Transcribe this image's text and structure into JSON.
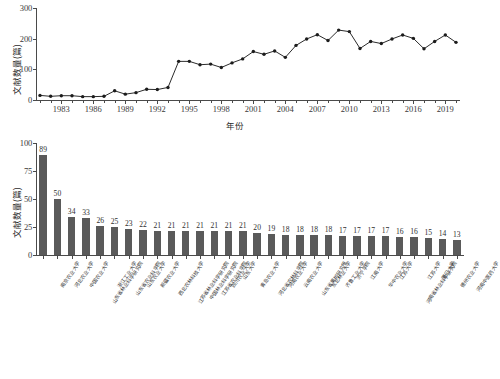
{
  "chart_data": [
    {
      "type": "line",
      "title": "",
      "xlabel": "年份",
      "ylabel": "文献数量(篇)",
      "ylim": [
        0,
        300
      ],
      "yticks": [
        0,
        100,
        200,
        300
      ],
      "xticks": [
        1983,
        1986,
        1989,
        1992,
        1995,
        1998,
        2001,
        2004,
        2007,
        2010,
        2013,
        2016,
        2019
      ],
      "xlim": [
        1981,
        2020
      ],
      "grid": false,
      "marker": "filled-circle",
      "x": [
        1981,
        1982,
        1983,
        1984,
        1985,
        1986,
        1987,
        1988,
        1989,
        1990,
        1991,
        1992,
        1993,
        1994,
        1995,
        1996,
        1997,
        1998,
        1999,
        2000,
        2001,
        2002,
        2003,
        2004,
        2005,
        2006,
        2007,
        2008,
        2009,
        2010,
        2011,
        2012,
        2013,
        2014,
        2015,
        2016,
        2017,
        2018,
        2019,
        2020
      ],
      "values": [
        15,
        12,
        14,
        14,
        11,
        11,
        12,
        30,
        19,
        24,
        35,
        34,
        41,
        126,
        126,
        115,
        117,
        106,
        121,
        134,
        158,
        149,
        160,
        139,
        178,
        199,
        213,
        194,
        228,
        223,
        168,
        191,
        184,
        199,
        212,
        201,
        167,
        191,
        212,
        188
      ]
    },
    {
      "type": "bar",
      "title": "",
      "xlabel": "",
      "ylabel": "文献数量(篇)",
      "ylim": [
        0,
        100
      ],
      "yticks": [
        0,
        25,
        50,
        75,
        100
      ],
      "grid": false,
      "bar_color": "#5a5a5a",
      "categories": [
        "南京农业大学",
        "河北农业大学",
        "中国农业大学",
        "山东省林业科学研究院",
        "浙江工业大学",
        "山东省农业科学院",
        "山东农业大学",
        "新疆农业大学",
        "西北农林科技大学",
        "江苏省林业科学研究院",
        "中国林业科学研究院",
        "江苏省农业科学院",
        "四川农业大学",
        "山东大学",
        "青岛农业大学",
        "河北省农林科学院",
        "河南农业大学",
        "云南农业大学",
        "山东省果树研究所",
        "东北林业大学",
        "齐鲁工业大学",
        "济宁学院",
        "江南大学",
        "华中农业大学",
        "江苏大学",
        "河南省林业科学研究院",
        "江苏大学",
        "厦门大学",
        "德州农业大学",
        "河南中医药大学"
      ],
      "values": [
        89,
        50,
        34,
        33,
        26,
        25,
        23,
        22,
        21,
        21,
        21,
        21,
        21,
        21,
        21,
        20,
        19,
        18,
        18,
        18,
        18,
        17,
        17,
        17,
        17,
        16,
        16,
        15,
        14,
        13
      ]
    }
  ],
  "line_chart": {
    "ylabel": "文献数量(篇)",
    "xlabel": "年份",
    "ytick_labels": [
      "300",
      "200",
      "100",
      "0"
    ],
    "xtick_labels": [
      "1983",
      "1986",
      "1989",
      "1992",
      "1995",
      "1998",
      "2001",
      "2004",
      "2007",
      "2010",
      "2013",
      "2016",
      "2019"
    ]
  },
  "bar_chart": {
    "ylabel": "文献数量(篇)",
    "ytick_labels": [
      "100",
      "75",
      "50",
      "25",
      "0"
    ]
  }
}
